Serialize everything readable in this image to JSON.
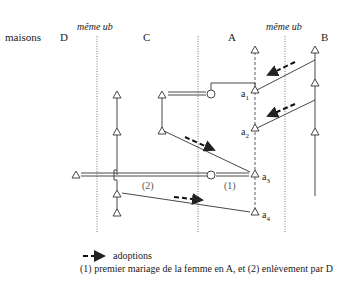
{
  "header": {
    "houses_label": "maisons",
    "house_D": "D",
    "house_C": "C",
    "house_A": "A",
    "house_B": "B",
    "same_ub_left": "même ub",
    "same_ub_right": "même ub"
  },
  "nodes": {
    "a1": "a",
    "a1_sub": "1",
    "a2": "a",
    "a2_sub": "2",
    "a3": "a",
    "a3_sub": "3",
    "a4": "a",
    "a4_sub": "4"
  },
  "annotations": {
    "marriage_1": "(1)",
    "marriage_2": "(2)"
  },
  "legend": {
    "adoptions": "adoptions",
    "note": "(1) premier mariage de la femme en A, et (2) enlèvement par D"
  }
}
